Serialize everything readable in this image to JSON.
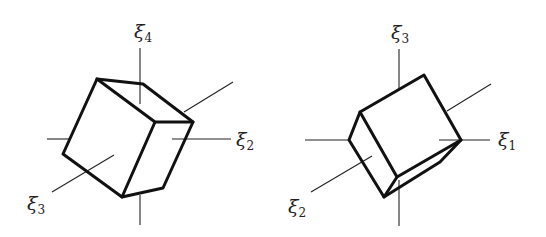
{
  "figures": [
    {
      "name": "left-cube",
      "labels": [
        {
          "sym": "ξ",
          "sub": "4",
          "x": 134,
          "y": 38
        },
        {
          "sym": "ξ",
          "sub": "2",
          "x": 236,
          "y": 146
        },
        {
          "sym": "ξ",
          "sub": "3",
          "x": 27,
          "y": 210
        }
      ]
    },
    {
      "name": "right-cube",
      "labels": [
        {
          "sym": "ξ",
          "sub": "3",
          "x": 391,
          "y": 39
        },
        {
          "sym": "ξ",
          "sub": "1",
          "x": 498,
          "y": 146
        },
        {
          "sym": "ξ",
          "sub": "2",
          "x": 288,
          "y": 213
        }
      ]
    }
  ]
}
